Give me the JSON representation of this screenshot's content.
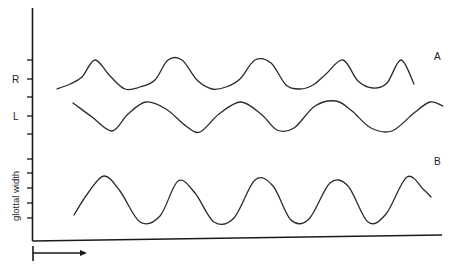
{
  "chart_data": {
    "type": "line",
    "title": "",
    "xlabel": "",
    "ylabel": "glottal width",
    "x_axis_arrow": "time",
    "grid": false,
    "legend": "none",
    "panels": [
      {
        "label": "A",
        "series": [
          {
            "name": "R",
            "description": "right side trace",
            "x": [
              57,
              70,
              82,
              95,
              110,
              125,
              140,
              155,
              168,
              182,
              197,
              212,
              226,
              240,
              255,
              271,
              286,
              300,
              313,
              326,
              343,
              358,
              373,
              387,
              401,
              414
            ],
            "y": [
              89,
              84,
              77,
              60,
              76,
              89,
              87,
              80,
              60,
              60,
              80,
              89,
              87,
              79,
              60,
              63,
              85,
              89,
              85,
              74,
              60,
              81,
              88,
              83,
              60,
              84
            ]
          },
          {
            "name": "L",
            "description": "left side trace",
            "x": [
              73,
              92,
              112,
              128,
              146,
              166,
              186,
              200,
              219,
              241,
              262,
              277,
              294,
              315,
              336,
              352,
              371,
              392,
              414,
              430,
              443
            ],
            "y": [
              103,
              117,
              131,
              114,
              102,
              109,
              126,
              132,
              114,
              102,
              115,
              130,
              128,
              106,
              101,
              111,
              128,
              131,
              113,
              102,
              106
            ]
          }
        ]
      },
      {
        "label": "B",
        "series": [
          {
            "name": "glottal width",
            "x": [
              74,
              88,
              104,
              120,
              140,
              160,
              178,
              195,
              214,
              234,
              255,
              273,
              291,
              309,
              330,
              348,
              368,
              386,
              407,
              424,
              431
            ],
            "y": [
              215,
              193,
              176,
              191,
              222,
              216,
              181,
              193,
              222,
              218,
              180,
              186,
              220,
              219,
              183,
              186,
              222,
              214,
              177,
              190,
              197
            ]
          }
        ]
      }
    ],
    "y_ticks": [
      {
        "label": "",
        "pos": 60
      },
      {
        "label": "R",
        "pos": 79
      },
      {
        "label": "",
        "pos": 97
      },
      {
        "label": "L",
        "pos": 116
      },
      {
        "label": "",
        "pos": 134
      },
      {
        "label": "",
        "pos": 159
      },
      {
        "label": "",
        "pos": 173
      },
      {
        "label": "",
        "pos": 188
      },
      {
        "label": "",
        "pos": 203
      },
      {
        "label": "",
        "pos": 218
      }
    ]
  }
}
